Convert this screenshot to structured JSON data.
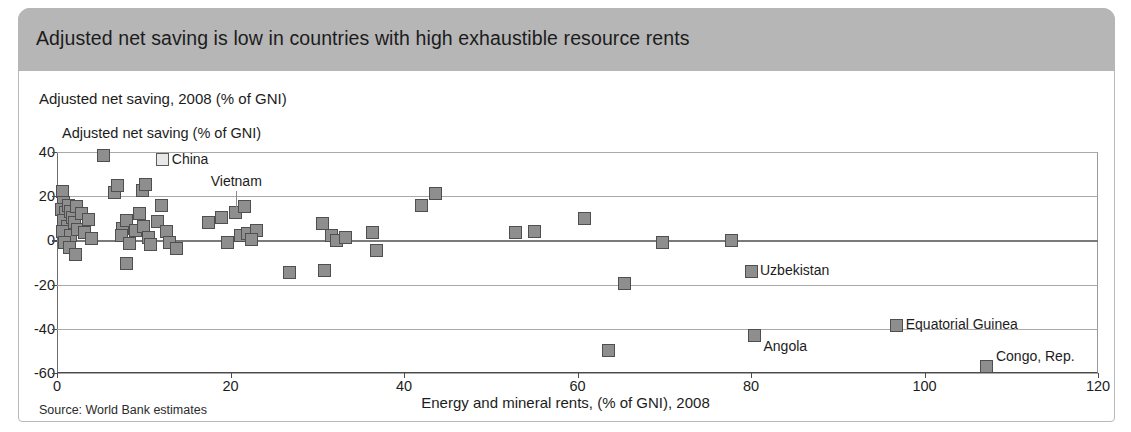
{
  "header": {
    "title": "Adjusted net saving is low in countries with high exhaustible resource rents"
  },
  "subtitle": "Adjusted net saving, 2008 (% of GNI)",
  "source": "Source: World Bank estimates",
  "colors": {
    "header_bar": "#b6b6b6",
    "marker_fill": "#8e8e8e",
    "marker_stroke": "#4f4f4f",
    "gridline": "#a9a9a9",
    "axis": "#4a4a4a",
    "text": "#1c1c1c"
  },
  "chart_data": {
    "type": "scatter",
    "title": "Adjusted net saving is low in countries with high exhaustible resource rents",
    "subtitle": "Adjusted net saving, 2008 (% of GNI)",
    "ylabel": "Adjusted net saving (% of GNI)",
    "xlabel": "Energy and mineral rents, (% of GNI), 2008",
    "source": "Source: World Bank estimates",
    "xlim": [
      0,
      120
    ],
    "ylim": [
      -60,
      40
    ],
    "xticks": [
      0,
      20,
      40,
      60,
      80,
      100,
      120
    ],
    "yticks": [
      40,
      20,
      0,
      -20,
      -40,
      -60
    ],
    "grid": "horizontal",
    "legend": "none",
    "points": [
      {
        "x": 0.6,
        "y": 22.0
      },
      {
        "x": 0.8,
        "y": 17.0
      },
      {
        "x": 0.5,
        "y": 14.0
      },
      {
        "x": 1.0,
        "y": 12.5
      },
      {
        "x": 0.7,
        "y": 9.0
      },
      {
        "x": 1.3,
        "y": 16.0
      },
      {
        "x": 1.6,
        "y": 13.0
      },
      {
        "x": 1.2,
        "y": 6.5
      },
      {
        "x": 0.6,
        "y": 4.0
      },
      {
        "x": 1.8,
        "y": 10.5
      },
      {
        "x": 2.2,
        "y": 15.5
      },
      {
        "x": 2.0,
        "y": 8.0
      },
      {
        "x": 1.5,
        "y": 2.0
      },
      {
        "x": 0.9,
        "y": -1.0
      },
      {
        "x": 1.4,
        "y": -3.0
      },
      {
        "x": 2.4,
        "y": 5.0
      },
      {
        "x": 2.8,
        "y": 12.0
      },
      {
        "x": 2.1,
        "y": -6.5
      },
      {
        "x": 3.2,
        "y": 3.5
      },
      {
        "x": 3.6,
        "y": 9.5
      },
      {
        "x": 4.0,
        "y": 1.0
      },
      {
        "x": 5.4,
        "y": 38.5
      },
      {
        "x": 6.6,
        "y": 21.5
      },
      {
        "x": 7.0,
        "y": 25.0
      },
      {
        "x": 7.6,
        "y": 5.5
      },
      {
        "x": 8.0,
        "y": 9.0
      },
      {
        "x": 7.4,
        "y": 2.0
      },
      {
        "x": 8.4,
        "y": -1.5
      },
      {
        "x": 8.0,
        "y": -10.5
      },
      {
        "x": 9.0,
        "y": 4.5
      },
      {
        "x": 9.5,
        "y": 12.0
      },
      {
        "x": 9.8,
        "y": 22.5
      },
      {
        "x": 10.2,
        "y": 25.5
      },
      {
        "x": 10.0,
        "y": 6.5
      },
      {
        "x": 10.6,
        "y": 1.5
      },
      {
        "x": 10.8,
        "y": -2.0
      },
      {
        "x": 11.6,
        "y": 8.5
      },
      {
        "x": 12.0,
        "y": 16.0
      },
      {
        "x": 12.2,
        "y": 36.5,
        "label": "China",
        "marker": "light"
      },
      {
        "x": 12.6,
        "y": 4.0
      },
      {
        "x": 13.0,
        "y": -1.0
      },
      {
        "x": 13.8,
        "y": -3.5
      },
      {
        "x": 17.5,
        "y": 8.0
      },
      {
        "x": 19.0,
        "y": 10.5
      },
      {
        "x": 19.6,
        "y": -1.0
      },
      {
        "x": 20.6,
        "y": 12.5,
        "label": "Vietnam"
      },
      {
        "x": 21.6,
        "y": 15.5
      },
      {
        "x": 21.2,
        "y": 2.0
      },
      {
        "x": 22.0,
        "y": 3.0
      },
      {
        "x": 23.0,
        "y": 4.5
      },
      {
        "x": 22.4,
        "y": 0.5
      },
      {
        "x": 26.8,
        "y": -14.5
      },
      {
        "x": 30.6,
        "y": 7.5
      },
      {
        "x": 30.8,
        "y": -13.5
      },
      {
        "x": 31.6,
        "y": 2.0
      },
      {
        "x": 32.2,
        "y": 0.0
      },
      {
        "x": 33.2,
        "y": 1.5
      },
      {
        "x": 36.4,
        "y": 3.5
      },
      {
        "x": 36.8,
        "y": -4.5
      },
      {
        "x": 42.0,
        "y": 16.0
      },
      {
        "x": 43.6,
        "y": 21.0
      },
      {
        "x": 52.8,
        "y": 3.5
      },
      {
        "x": 55.0,
        "y": 4.0
      },
      {
        "x": 60.8,
        "y": 10.0
      },
      {
        "x": 63.6,
        "y": -50.0
      },
      {
        "x": 65.4,
        "y": -19.5
      },
      {
        "x": 69.8,
        "y": -1.0
      },
      {
        "x": 77.8,
        "y": 0.0
      },
      {
        "x": 80.0,
        "y": -14.0,
        "label": "Uzbekistan"
      },
      {
        "x": 80.4,
        "y": -43.0,
        "label": "Angola",
        "label_pos": "below"
      },
      {
        "x": 96.8,
        "y": -38.5,
        "label": "Equatorial Guinea"
      },
      {
        "x": 107.2,
        "y": -57.0,
        "label": "Congo, Rep.",
        "label_pos": "above"
      }
    ]
  }
}
